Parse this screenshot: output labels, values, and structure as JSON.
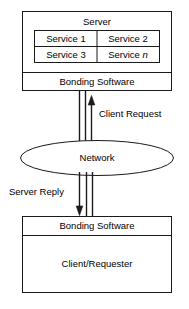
{
  "diagram": {
    "stroke_color": "#1a1a1a",
    "fill_color": "#ffffff",
    "text_color": "#000000",
    "server_box": {
      "title": "Server",
      "services": [
        [
          "Service 1",
          "Service 2"
        ],
        [
          "Service 3",
          "Service n"
        ]
      ],
      "service_n_italic_token": "n",
      "bonding_label": "Bonding Software"
    },
    "network": {
      "label": "Network",
      "shape": "ellipse"
    },
    "client_box": {
      "bonding_label": "Bonding Software",
      "body_label": "Client/Requester"
    },
    "flows": [
      {
        "label": "Client Request",
        "direction": "up",
        "from": "client",
        "to": "server"
      },
      {
        "label": "Server Reply",
        "direction": "down",
        "from": "server",
        "to": "client"
      }
    ]
  }
}
